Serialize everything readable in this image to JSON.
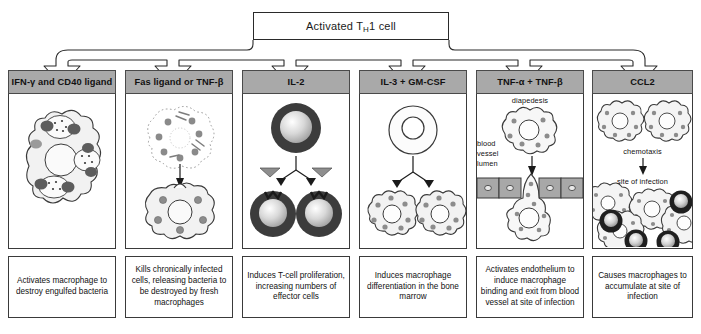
{
  "title": {
    "prefix": "Activated T",
    "sub": "H",
    "suffix": "1 cell"
  },
  "columns": [
    {
      "id": "ifn-cd40",
      "header": "IFN-γ and CD40 ligand",
      "caption": "Activates macrophage to destroy engulfed bacteria",
      "art_labels": []
    },
    {
      "id": "fas-tnfb",
      "header": "Fas ligand or TNF-β",
      "caption": "Kills chronically infected cells, releasing bacteria to be destroyed by fresh macrophages",
      "art_labels": []
    },
    {
      "id": "il-2",
      "header": "IL-2",
      "caption": "Induces T-cell proliferation, increasing numbers of effector cells",
      "art_labels": []
    },
    {
      "id": "il3-gmcsf",
      "header": "IL-3 + GM-CSF",
      "caption": "Induces macrophage differentiation in the bone marrow",
      "art_labels": []
    },
    {
      "id": "tnfa-tnfb",
      "header": "TNF-α + TNF-β",
      "caption": "Activates endothelium to induce macrophage binding and exit from blood vessel at site of infection",
      "art_labels": [
        "diapedesis",
        "blood",
        "vessel",
        "lumen"
      ]
    },
    {
      "id": "ccl2",
      "header": "CCL2",
      "caption": "Causes macrophages to accumulate at site of infection",
      "art_labels": [
        "chemotaxis",
        "site of infection"
      ]
    }
  ],
  "colors": {
    "header_fill": "#a9a9a9",
    "outline": "#3a3a3a",
    "cell_fill": "#f2f2f2",
    "granule": "#8c8c8c",
    "dark_cell": "#2b2b2b",
    "endothelium": "#a8a8a8"
  }
}
